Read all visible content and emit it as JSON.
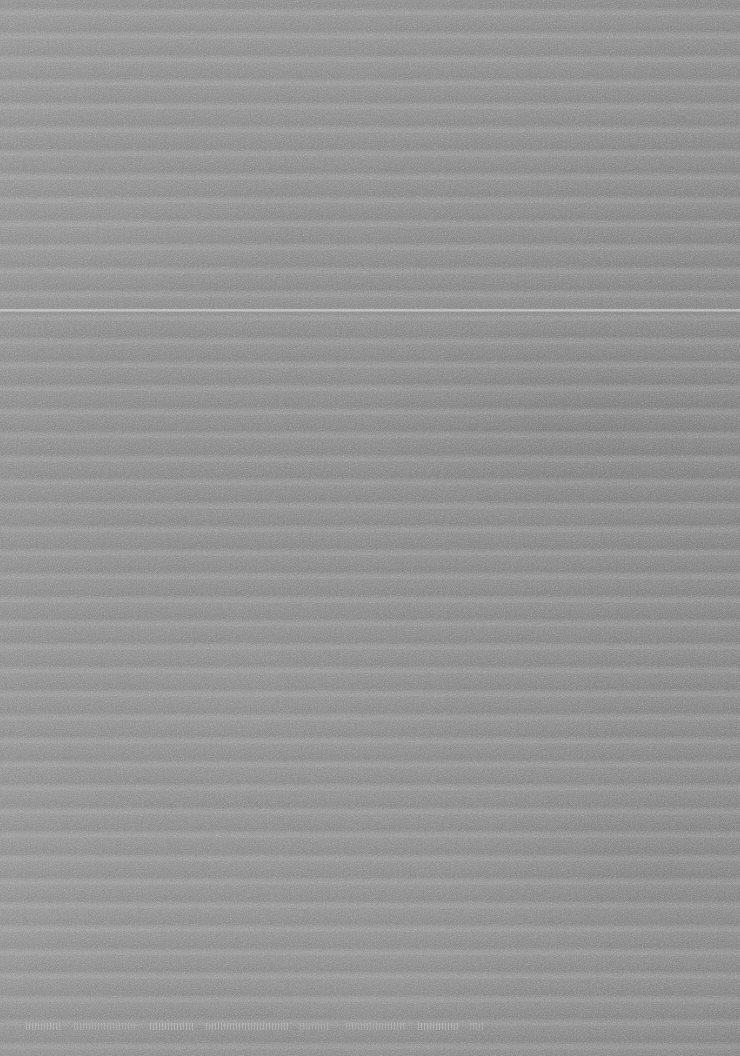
{
  "image": {
    "kind": "degraded-scan-surface",
    "description": "Full-frame field of horizontal gray stripes with film-grain noise; no legible interface content",
    "width_px": 740,
    "height_px": 1056,
    "legible_text": "none",
    "background_color": "#858585",
    "stripe_light_color": "#9a9a9a",
    "stripe_dark_color": "#7d7d7d"
  },
  "pattern": {
    "name": "horizontal-stripes",
    "orientation": "horizontal",
    "period_px": 23.5,
    "light_band_height_px": 8,
    "dark_band_height_px": 15,
    "first_light_band_top_px": 13,
    "band_count": 45,
    "coverage": "full-bleed, edge to edge, no border or margin"
  },
  "features": {
    "bright_scanline": {
      "label": "bright-scanline",
      "y_px": 310,
      "thickness_px": 3,
      "extent": "full width",
      "relative_brightness": "brighter than all other stripes"
    },
    "text_remnants": {
      "label": "illegible-text-remnants",
      "y_px": 1026,
      "height_px": 7,
      "readable": false,
      "note": "vertical stroke fragments only; characters not recoverable",
      "segments": [
        {
          "x_px": 26,
          "width_px": 36
        },
        {
          "x_px": 74,
          "width_px": 62
        },
        {
          "x_px": 150,
          "width_px": 44
        },
        {
          "x_px": 206,
          "width_px": 84
        },
        {
          "x_px": 300,
          "width_px": 30
        },
        {
          "x_px": 346,
          "width_px": 58
        },
        {
          "x_px": 418,
          "width_px": 40
        },
        {
          "x_px": 470,
          "width_px": 14
        }
      ]
    },
    "noise": {
      "label": "film-grain",
      "character": "fine luminance speckle over entire frame",
      "strength": "low"
    }
  },
  "content_summary": {
    "headline": "No readable content",
    "detail": "The frame contains no text, icons, charts, controls or other interface elements. It is a uniform striped texture, consistent with a blank or heavily degraded scan."
  }
}
